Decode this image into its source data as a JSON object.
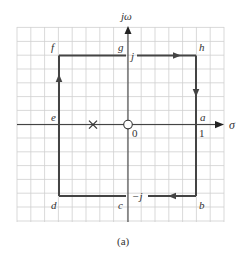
{
  "figure": {
    "caption": "(a)",
    "axes": {
      "vertical_label": "jω",
      "horizontal_label": "σ",
      "origin_label": "0",
      "unit_label": "1"
    },
    "contour_points": {
      "a": "a",
      "b": "b",
      "c": "c",
      "d": "d",
      "e": "e",
      "f": "f",
      "g": "g",
      "h": "h"
    },
    "imag_labels": {
      "top": "j",
      "bottom": "−j"
    },
    "pole": {
      "marker": "x-icon",
      "sigma": -0.5
    },
    "zero": {
      "marker": "circle-icon",
      "sigma": 0
    },
    "contour": {
      "type": "square",
      "corners": {
        "top_left": [
          -1,
          1
        ],
        "top_right": [
          1,
          1
        ],
        "bottom_right": [
          1,
          -1
        ],
        "bottom_left": [
          -1,
          -1
        ]
      },
      "direction": "clockwise"
    },
    "colors": {
      "grid": "#cfcfcf",
      "contour": "#444444",
      "axes": "#333333"
    }
  }
}
